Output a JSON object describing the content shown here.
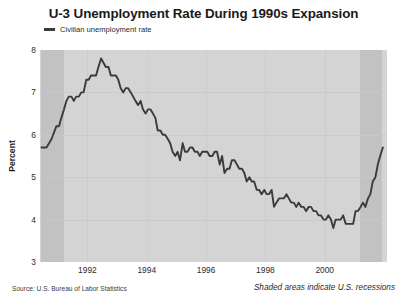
{
  "chart_data": {
    "type": "line",
    "title": "U-3 Unemployment Rate During 1990s Expansion",
    "xlabel": "",
    "ylabel": "Percent",
    "xlim": [
      1990.4,
      2002.1
    ],
    "ylim": [
      3,
      8
    ],
    "yticks": [
      3,
      4,
      5,
      6,
      7,
      8
    ],
    "xticks": [
      1992,
      1994,
      1996,
      1998,
      2000
    ],
    "grid": true,
    "legend_position": "top-left",
    "line_color": "#3b3b3b",
    "plot_bg_color": "#d4d4d4",
    "recession_band_color": "#c2c2c2",
    "series": [
      {
        "name": "Civilian unemployment rate",
        "x": [
          1990.45,
          1990.62,
          1990.79,
          1990.95,
          1991.04,
          1991.12,
          1991.21,
          1991.29,
          1991.37,
          1991.46,
          1991.54,
          1991.62,
          1991.71,
          1991.79,
          1991.87,
          1991.96,
          1992.04,
          1992.12,
          1992.21,
          1992.29,
          1992.37,
          1992.46,
          1992.54,
          1992.62,
          1992.71,
          1992.79,
          1992.87,
          1992.96,
          1993.04,
          1993.12,
          1993.21,
          1993.29,
          1993.37,
          1993.46,
          1993.54,
          1993.62,
          1993.71,
          1993.79,
          1993.87,
          1993.96,
          1994.04,
          1994.12,
          1994.21,
          1994.29,
          1994.37,
          1994.46,
          1994.54,
          1994.62,
          1994.71,
          1994.79,
          1994.87,
          1994.96,
          1995.04,
          1995.12,
          1995.21,
          1995.29,
          1995.37,
          1995.46,
          1995.54,
          1995.62,
          1995.71,
          1995.79,
          1995.87,
          1995.96,
          1996.04,
          1996.12,
          1996.21,
          1996.29,
          1996.37,
          1996.46,
          1996.54,
          1996.62,
          1996.71,
          1996.79,
          1996.87,
          1996.96,
          1997.04,
          1997.12,
          1997.21,
          1997.29,
          1997.37,
          1997.46,
          1997.54,
          1997.62,
          1997.71,
          1997.79,
          1997.87,
          1997.96,
          1998.04,
          1998.12,
          1998.21,
          1998.29,
          1998.37,
          1998.46,
          1998.54,
          1998.62,
          1998.71,
          1998.79,
          1998.87,
          1998.96,
          1999.04,
          1999.12,
          1999.21,
          1999.29,
          1999.37,
          1999.46,
          1999.54,
          1999.62,
          1999.71,
          1999.79,
          1999.87,
          1999.96,
          2000.04,
          2000.12,
          2000.21,
          2000.29,
          2000.37,
          2000.46,
          2000.54,
          2000.62,
          2000.71,
          2000.79,
          2000.87,
          2000.96,
          2001.04,
          2001.12,
          2001.21,
          2001.29,
          2001.37,
          2001.46,
          2001.54,
          2001.62,
          2001.71,
          2001.79,
          2001.87,
          2001.96
        ],
        "values": [
          5.7,
          5.7,
          5.9,
          6.2,
          6.2,
          6.4,
          6.6,
          6.8,
          6.9,
          6.9,
          6.8,
          6.9,
          6.9,
          7.0,
          7.0,
          7.3,
          7.3,
          7.4,
          7.4,
          7.4,
          7.6,
          7.8,
          7.7,
          7.6,
          7.6,
          7.4,
          7.4,
          7.4,
          7.3,
          7.1,
          7.0,
          7.1,
          7.1,
          7.0,
          6.9,
          6.8,
          6.7,
          6.8,
          6.6,
          6.5,
          6.6,
          6.6,
          6.5,
          6.4,
          6.1,
          6.1,
          6.0,
          6.0,
          5.9,
          5.8,
          5.6,
          5.5,
          5.6,
          5.4,
          5.8,
          5.6,
          5.6,
          5.7,
          5.7,
          5.6,
          5.6,
          5.5,
          5.6,
          5.6,
          5.6,
          5.5,
          5.5,
          5.6,
          5.6,
          5.3,
          5.5,
          5.1,
          5.2,
          5.2,
          5.4,
          5.4,
          5.3,
          5.2,
          5.2,
          5.1,
          4.9,
          5.0,
          4.9,
          4.9,
          4.7,
          4.7,
          4.6,
          4.7,
          4.6,
          4.6,
          4.7,
          4.3,
          4.4,
          4.5,
          4.5,
          4.5,
          4.6,
          4.5,
          4.4,
          4.4,
          4.3,
          4.4,
          4.3,
          4.3,
          4.2,
          4.3,
          4.3,
          4.2,
          4.2,
          4.1,
          4.1,
          4.0,
          4.0,
          4.1,
          4.0,
          3.8,
          4.0,
          4.0,
          4.0,
          4.1,
          3.9,
          3.9,
          3.9,
          3.9,
          4.2,
          4.2,
          4.3,
          4.4,
          4.3,
          4.5,
          4.6,
          4.9,
          5.0,
          5.3,
          5.5,
          5.7
        ]
      }
    ],
    "recessions": [
      {
        "start": 1990.45,
        "end": 1991.2
      },
      {
        "start": 2001.2,
        "end": 2001.92
      }
    ],
    "annotations": {
      "source": "Source: U.S. Bureau of Labor Statistics",
      "recession_note": "Shaded areas indicate U.S. recessions"
    }
  }
}
